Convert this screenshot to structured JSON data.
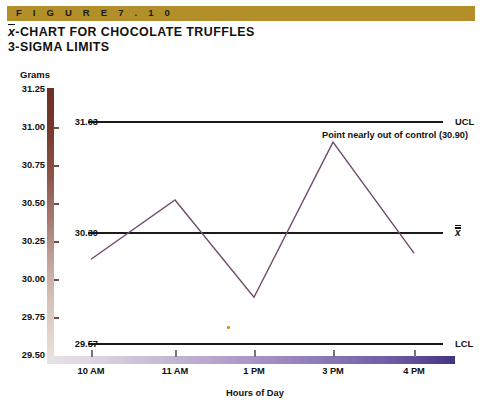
{
  "figure": {
    "banner_label": "F I G U R E   7 . 1 0",
    "banner_color": "#b38f2a",
    "title_line1_prefix": "x",
    "title_line1_rest": "-CHART FOR CHOCOLATE TRUFFLES",
    "title_line2": "3-SIGMA LIMITS"
  },
  "annotation": {
    "text": "Point nearly out of control (30.90)"
  },
  "axis_labels": {
    "y_title": "Grams",
    "x_title": "Hours of Day"
  },
  "limits": {
    "ucl_value": "31.03",
    "ucl_name": "UCL",
    "center_value": "30.30",
    "center_name": "x",
    "lcl_value": "29.57",
    "lcl_name": "LCL"
  },
  "colors": {
    "line": "#6e4d6b",
    "control_line": "#1b1b1b",
    "y_axis_top": "#6b3026",
    "y_axis_bottom": "#e9e0d9",
    "x_axis_left": "#e6e2e6",
    "x_axis_right": "#42367f",
    "banner": "#b38f2a",
    "stray_dot": "#d98b2a"
  },
  "chart_data": {
    "type": "line",
    "subtitle": "",
    "xlabel": "Hours of Day",
    "ylabel": "Grams",
    "categories": [
      "10 AM",
      "11 AM",
      "1 PM",
      "3 PM",
      "4 PM"
    ],
    "values": [
      30.13,
      30.52,
      29.88,
      30.9,
      30.17
    ],
    "ylim": [
      29.5,
      31.25
    ],
    "ytick_values": [
      "29.50",
      "29.75",
      "30.00",
      "30.25",
      "30.50",
      "30.75",
      "31.00",
      "31.25"
    ],
    "grid": false,
    "legend": "none",
    "reference_lines": [
      {
        "name": "UCL",
        "label": "UCL",
        "value": 31.03,
        "value_label": "31.03"
      },
      {
        "name": "center",
        "label": "x̄̄",
        "value": 30.3,
        "value_label": "30.30"
      },
      {
        "name": "LCL",
        "label": "LCL",
        "value": 29.57,
        "value_label": "29.57"
      }
    ],
    "annotations": [
      {
        "text": "Point nearly out of control (30.90)",
        "x": "3 PM",
        "y": 30.9
      }
    ]
  }
}
